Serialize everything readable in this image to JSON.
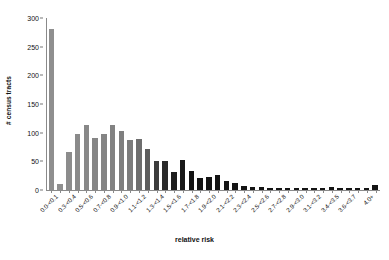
{
  "chart_data": {
    "type": "bar",
    "title": "",
    "xlabel": "relative risk",
    "ylabel": "# census tracts",
    "ylim": [
      0,
      300
    ],
    "ytick_values": [
      0,
      50,
      100,
      150,
      200,
      250,
      300
    ],
    "ytick_labels": [
      "0",
      "50",
      "100",
      "150",
      "200",
      "250",
      "300"
    ],
    "grid": false,
    "legend": "none",
    "bar_colors": {
      "light": "#8c8c8c",
      "dark": "#141414"
    },
    "categories": [
      "0.0-<0.1",
      "0.1-<0.2",
      "0.2-<0.3",
      "0.3-<0.4",
      "0.4-<0.5",
      "0.5-<0.6",
      "0.6-<0.7",
      "0.7-<0.8",
      "0.8-<0.9",
      "0.9-<1.0",
      "1.0-<1.1",
      "1.1-<1.2",
      "1.2-<1.3",
      "1.3-<1.4",
      "1.4-<1.5",
      "1.5-<1.6",
      "1.6-<1.7",
      "1.7-<1.8",
      "1.8-<1.9",
      "1.9-<2.0",
      "2.0-<2.1",
      "2.1-<2.2",
      "2.2-<2.3",
      "2.3-<2.4",
      "2.4-<2.5",
      "2.5-<2.6",
      "2.6-<2.7",
      "2.7-<2.8",
      "2.8-<2.9",
      "2.9-<3.0",
      "3.0-<3.1",
      "3.1-<3.2",
      "3.2-<3.3",
      "3.4-<3.5",
      "3.5-<3.6",
      "3.6-<3.7",
      "3.7-<3.8",
      "4.0+"
    ],
    "xtick_labels_shown": [
      "0.0-<0.1",
      "0.3-<0.4",
      "0.5-<0.6",
      "0.7-<0.8",
      "0.9-<1.0",
      "1.1-<1.2",
      "1.3-<1.4",
      "1.5-<1.6",
      "1.7-<1.8",
      "1.9-<2.0",
      "2.1-<2.2",
      "2.3-<2.4",
      "2.5-<2.6",
      "2.7-<2.8",
      "2.9-<3.0",
      "3.1-<3.2",
      "3.4-<3.5",
      "3.6-<3.7",
      "4.0+"
    ],
    "values": [
      280,
      10,
      67,
      98,
      114,
      90,
      98,
      113,
      103,
      87,
      89,
      71,
      51,
      51,
      32,
      53,
      33,
      21,
      22,
      27,
      15,
      13,
      7,
      6,
      5,
      3,
      2,
      1,
      1,
      1,
      1,
      1,
      6,
      1,
      1,
      1,
      1,
      9
    ],
    "shades": [
      "#8f8f8f",
      "#8f8f8f",
      "#8c8c8c",
      "#8a8a8a",
      "#888888",
      "#868686",
      "#848484",
      "#828282",
      "#7f7f7f",
      "#7c7c7c",
      "#6e6e6e",
      "#5e5e5e",
      "#3c3c3c",
      "#2a2a2a",
      "#1e1e1e",
      "#181818",
      "#141414",
      "#141414",
      "#141414",
      "#141414",
      "#141414",
      "#141414",
      "#141414",
      "#141414",
      "#141414",
      "#141414",
      "#141414",
      "#141414",
      "#141414",
      "#141414",
      "#141414",
      "#141414",
      "#141414",
      "#141414",
      "#141414",
      "#141414",
      "#141414",
      "#141414"
    ]
  }
}
